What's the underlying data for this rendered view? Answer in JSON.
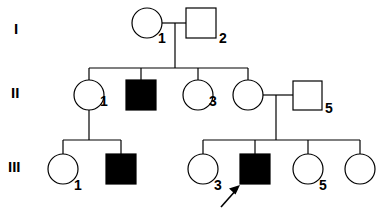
{
  "figure": {
    "kind": "pedigree-chart",
    "title": "",
    "background_color": "#ffffff",
    "line_color": "#000000",
    "affected_fill": "#000000",
    "unaffected_fill": "#ffffff"
  },
  "generations": [
    {
      "label": "I",
      "x": 14,
      "y": 34
    },
    {
      "label": "II",
      "x": 11,
      "y": 98
    },
    {
      "label": "III",
      "x": 8,
      "y": 172
    }
  ],
  "individuals": [
    {
      "id": "I-1",
      "generation": "I",
      "number": "1",
      "sex": "female",
      "shape": "circle",
      "affected": false,
      "cx": 147,
      "cy": 23,
      "r": 15,
      "label_x": 158,
      "label_y": 43
    },
    {
      "id": "I-2",
      "generation": "I",
      "number": "2",
      "sex": "male",
      "shape": "square",
      "affected": false,
      "x": 186,
      "y": 8,
      "size": 30,
      "label_x": 219,
      "label_y": 43
    },
    {
      "id": "II-1",
      "generation": "II",
      "number": "1",
      "sex": "female",
      "shape": "circle",
      "affected": false,
      "cx": 89,
      "cy": 95,
      "r": 15,
      "label_x": 100,
      "label_y": 106
    },
    {
      "id": "II-2",
      "generation": "II",
      "number": "",
      "sex": "male",
      "shape": "square",
      "affected": true,
      "x": 126,
      "y": 80,
      "size": 30,
      "label_x": 0,
      "label_y": 0
    },
    {
      "id": "II-3",
      "generation": "II",
      "number": "3",
      "sex": "female",
      "shape": "circle",
      "affected": false,
      "cx": 198,
      "cy": 95,
      "r": 15,
      "label_x": 209,
      "label_y": 106
    },
    {
      "id": "II-4",
      "generation": "II",
      "number": "",
      "sex": "female",
      "shape": "circle",
      "affected": false,
      "cx": 248,
      "cy": 95,
      "r": 15,
      "label_x": 0,
      "label_y": 0
    },
    {
      "id": "II-5",
      "generation": "II",
      "number": "5",
      "sex": "male",
      "shape": "square",
      "affected": false,
      "x": 293,
      "y": 81,
      "size": 29,
      "label_x": 325,
      "label_y": 113
    },
    {
      "id": "III-1",
      "generation": "III",
      "number": "1",
      "sex": "female",
      "shape": "circle",
      "affected": false,
      "cx": 63,
      "cy": 169,
      "r": 15,
      "label_x": 74,
      "label_y": 190
    },
    {
      "id": "III-2",
      "generation": "III",
      "number": "",
      "sex": "male",
      "shape": "square",
      "affected": true,
      "x": 106,
      "y": 154,
      "size": 30,
      "label_x": 0,
      "label_y": 0
    },
    {
      "id": "III-3",
      "generation": "III",
      "number": "3",
      "sex": "female",
      "shape": "circle",
      "affected": false,
      "cx": 203,
      "cy": 169,
      "r": 15,
      "label_x": 214,
      "label_y": 190
    },
    {
      "id": "III-4",
      "generation": "III",
      "number": "",
      "sex": "male",
      "shape": "square",
      "affected": true,
      "proband": true,
      "x": 240,
      "y": 154,
      "size": 30,
      "label_x": 0,
      "label_y": 0
    },
    {
      "id": "III-5",
      "generation": "III",
      "number": "5",
      "sex": "female",
      "shape": "circle",
      "affected": false,
      "cx": 308,
      "cy": 169,
      "r": 15,
      "label_x": 319,
      "label_y": 190
    },
    {
      "id": "III-6",
      "generation": "III",
      "number": "",
      "sex": "female",
      "shape": "circle",
      "affected": false,
      "cx": 360,
      "cy": 169,
      "r": 15,
      "label_x": 0,
      "label_y": 0
    }
  ],
  "matings": [
    {
      "id": "mating-I",
      "partners": [
        "I-1",
        "I-2"
      ],
      "line": "M 162 23 L 186 23",
      "descent": "M 175 23 L 175 68"
    },
    {
      "id": "mating-II-1",
      "partners": [
        "II-1"
      ],
      "descent": "M 89 110 L 89 140"
    },
    {
      "id": "mating-II-4",
      "partners": [
        "II-4",
        "II-5"
      ],
      "line": "M 263 95 L 293 95",
      "descent": "M 276 95 L 276 140"
    }
  ],
  "sibships": [
    {
      "id": "sibship-II",
      "parents": "I-1 x I-2",
      "bar": "M 89 68 L 248 68",
      "drops": [
        "M 89 68 L 89 80",
        "M 141 68 L 141 80",
        "M 198 68 L 198 80",
        "M 248 68 L 248 80"
      ]
    },
    {
      "id": "sibship-III-left",
      "parents": "II-1",
      "bar": "M 63 140 L 121 140",
      "drops": [
        "M 63 140 L 63 154",
        "M 121 140 L 121 154"
      ]
    },
    {
      "id": "sibship-III-right",
      "parents": "II-4 x II-5",
      "bar": "M 203 140 L 360 140",
      "drops": [
        "M 203 140 L 203 154",
        "M 255 140 L 255 154",
        "M 308 140 L 308 154",
        "M 360 140 L 360 154"
      ]
    }
  ],
  "proband_arrow": {
    "id": "proband-arrow",
    "points_to": "III-4",
    "shaft": "M 221 207 L 237 189",
    "head": "239 186 231 190 236 194"
  }
}
